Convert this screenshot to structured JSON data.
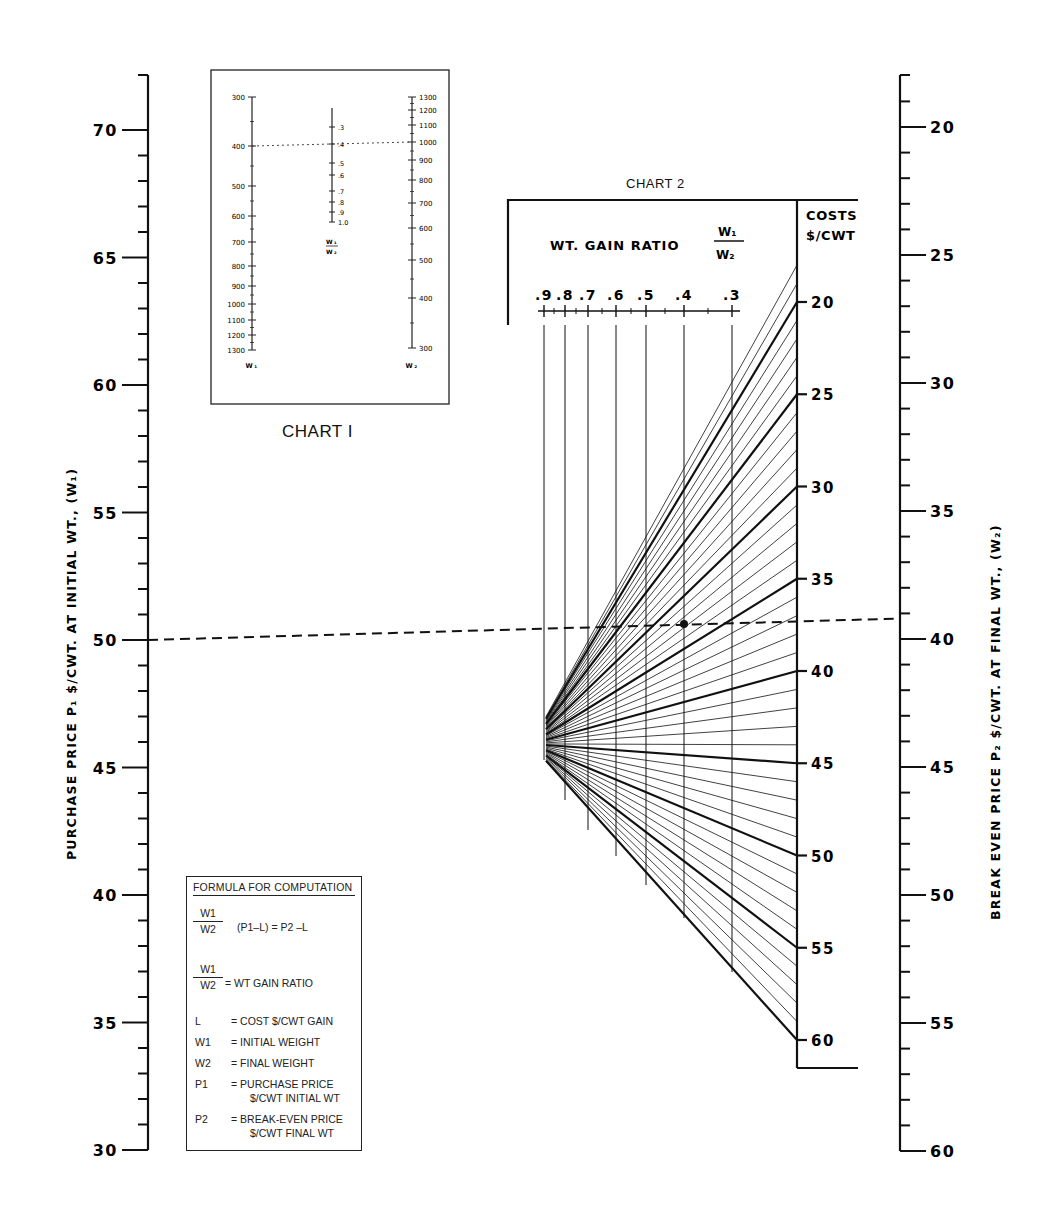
{
  "chart_data": {
    "type": "nomogram",
    "left_axis": {
      "label": "PURCHASE PRICE P1 $/CWT. AT INITIAL WT., (W1)",
      "ticks": [
        30,
        35,
        40,
        45,
        50,
        55,
        60,
        65,
        70
      ],
      "minor_step": 1,
      "range": [
        30,
        71
      ]
    },
    "right_axis": {
      "label": "BREAK EVEN PRICE P2 $/CWT. AT FINAL WT., (W2)",
      "ticks": [
        20,
        25,
        30,
        35,
        40,
        45,
        50,
        55,
        60
      ],
      "minor_step": 1,
      "range": [
        19,
        60
      ]
    },
    "chart1": {
      "caption": "CHART I",
      "w1_scale": {
        "label": "W1",
        "ticks": [
          300,
          400,
          500,
          600,
          700,
          800,
          900,
          1000,
          1100,
          1200,
          1300
        ]
      },
      "ratio_scale": {
        "label": "W1/W2",
        "ticks": [
          ".3",
          ".4",
          ".5",
          ".6",
          ".7",
          ".8",
          ".9",
          "1.0"
        ]
      },
      "w2_scale": {
        "label": "W2",
        "ticks": [
          1300,
          1200,
          1100,
          1000,
          900,
          800,
          700,
          600,
          500,
          400,
          300
        ]
      },
      "example": {
        "w1": 400,
        "ratio": 0.4,
        "w2": 1000
      }
    },
    "chart2": {
      "caption": "CHART 2",
      "ratio_axis": {
        "title": "WT. GAIN RATIO",
        "fraction": "W1/W2",
        "ticks": [
          ".9",
          ".8",
          ".7",
          ".6",
          ".5",
          ".4",
          ".3"
        ]
      },
      "cost_axis": {
        "title_line1": "COSTS",
        "title_line2": "$/CWT",
        "ticks": [
          20,
          25,
          30,
          35,
          40,
          45,
          50,
          55,
          60
        ],
        "minor_step": 1
      }
    },
    "example_line": {
      "p1": 50,
      "ratio": 0.4,
      "cost": 38,
      "p2": 39.2
    }
  },
  "labels": {
    "left_axis_title": "PURCHASE PRICE  P₁  $/CWT. AT INITIAL  WT., (W₁)",
    "right_axis_title": "BREAK  EVEN  PRICE  P₂  $/CWT. AT FINAL  WT., (W₂)",
    "chart1_caption": "CHART I",
    "chart2_caption": "CHART 2",
    "chart2_ratio_title": "WT.  GAIN  RATIO",
    "chart2_ratio_num": "W₁",
    "chart2_ratio_den": "W₂",
    "costs_title_1": "COSTS",
    "costs_title_2": "$/CWT"
  },
  "formula": {
    "title": "FORMULA FOR COMPUTATION",
    "eq_num": "W1",
    "eq_den": "W2",
    "eq_rhs": "(P1–L) = P2 –L",
    "ratio_num": "W1",
    "ratio_den": "W2",
    "ratio_def": "= WT  GAIN RATIO",
    "defs": [
      {
        "sym": "L",
        "text": "=  COST $/CWT  GAIN"
      },
      {
        "sym": "W1",
        "text": "=  INITIAL WEIGHT"
      },
      {
        "sym": "W2",
        "text": "=  FINAL WEIGHT"
      },
      {
        "sym": "P1",
        "text": "=  PURCHASE PRICE",
        "text2": "$/CWT  INITIAL WT"
      },
      {
        "sym": "P2",
        "text": "=  BREAK-EVEN PRICE",
        "text2": "$/CWT  FINAL WT"
      }
    ]
  }
}
